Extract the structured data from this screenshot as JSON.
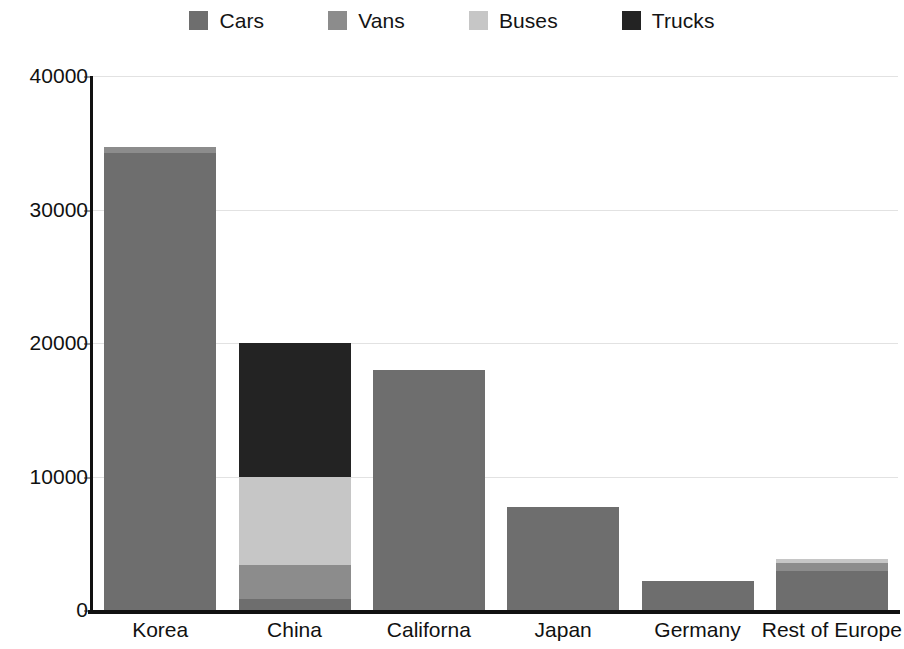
{
  "chart_data": {
    "type": "bar",
    "subtype": "stacked-bar",
    "title": "",
    "subtitle": "",
    "xlabel": "",
    "ylabel": "",
    "categories": [
      "Korea",
      "China",
      "Californa",
      "Japan",
      "Germany",
      "Rest of Europe"
    ],
    "series": [
      {
        "name": "Cars",
        "color": "#6e6e6e",
        "values": [
          34200,
          800,
          18000,
          7700,
          2200,
          2900
        ]
      },
      {
        "name": "Vans",
        "color": "#8c8c8c",
        "values": [
          500,
          2600,
          0,
          0,
          0,
          600
        ]
      },
      {
        "name": "Buses",
        "color": "#c6c6c6",
        "values": [
          0,
          6600,
          0,
          0,
          0,
          300
        ]
      },
      {
        "name": "Trucks",
        "color": "#232323",
        "values": [
          0,
          10000,
          0,
          0,
          0,
          0
        ]
      }
    ],
    "totals": [
      34700,
      20000,
      18000,
      7700,
      2200,
      3800
    ],
    "ylim": [
      0,
      40000
    ],
    "yticks": [
      0,
      10000,
      20000,
      30000,
      40000
    ],
    "ytick_labels": [
      "0",
      "10000",
      "20000",
      "30000",
      "40000"
    ],
    "grid": true,
    "grid_axis": "y",
    "legend_position": "top",
    "legend_entries": [
      "Cars",
      "Vans",
      "Buses",
      "Trucks"
    ]
  },
  "legend": {
    "items": [
      {
        "label": "Cars",
        "color": "#6e6e6e"
      },
      {
        "label": "Vans",
        "color": "#8c8c8c"
      },
      {
        "label": "Buses",
        "color": "#c6c6c6"
      },
      {
        "label": "Trucks",
        "color": "#232323"
      }
    ]
  },
  "axes": {
    "y": {
      "ticks": [
        "0",
        "10000",
        "20000",
        "30000",
        "40000"
      ]
    },
    "x": {
      "ticks": [
        "Korea",
        "China",
        "Californa",
        "Japan",
        "Germany",
        "Rest of Europe"
      ]
    }
  },
  "colors": {
    "background": "#ffffff",
    "axis": "#111111",
    "gridline": "#e2e2e2",
    "text": "#111111",
    "cars": "#6e6e6e",
    "vans": "#8c8c8c",
    "buses": "#c6c6c6",
    "trucks": "#232323"
  }
}
